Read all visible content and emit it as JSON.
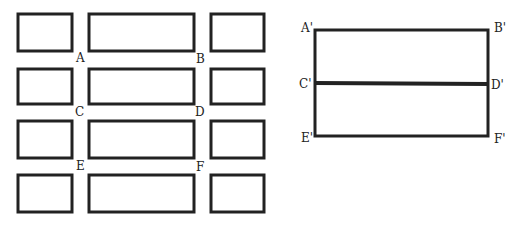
{
  "figure": {
    "left_grid": {
      "rows": [
        {
          "y": 14,
          "h": 37
        },
        {
          "y": 69,
          "h": 35
        },
        {
          "y": 121,
          "h": 37
        },
        {
          "y": 175,
          "h": 37
        }
      ],
      "columns": [
        {
          "x": 18,
          "w": 54
        },
        {
          "x": 89,
          "w": 105
        },
        {
          "x": 211,
          "w": 53
        }
      ],
      "labels": [
        {
          "text": "A",
          "x": 76,
          "y": 62
        },
        {
          "text": "B",
          "x": 196,
          "y": 63
        },
        {
          "text": "C",
          "x": 75,
          "y": 116
        },
        {
          "text": "D",
          "x": 195,
          "y": 116
        },
        {
          "text": "E",
          "x": 76,
          "y": 170
        },
        {
          "text": "F",
          "x": 196,
          "y": 171
        }
      ]
    },
    "right_diagram": {
      "rect": {
        "x": 315,
        "y": 30,
        "w": 173,
        "h": 106
      },
      "divider_y": 83,
      "labels": [
        {
          "text": "A'",
          "x": 301,
          "y": 32
        },
        {
          "text": "B'",
          "x": 494,
          "y": 32
        },
        {
          "text": "C'",
          "x": 299,
          "y": 88
        },
        {
          "text": "D'",
          "x": 491,
          "y": 89
        },
        {
          "text": "E'",
          "x": 301,
          "y": 142
        },
        {
          "text": "F'",
          "x": 494,
          "y": 143
        }
      ]
    },
    "colors": {
      "stroke": "#222222",
      "background": "#ffffff"
    }
  }
}
